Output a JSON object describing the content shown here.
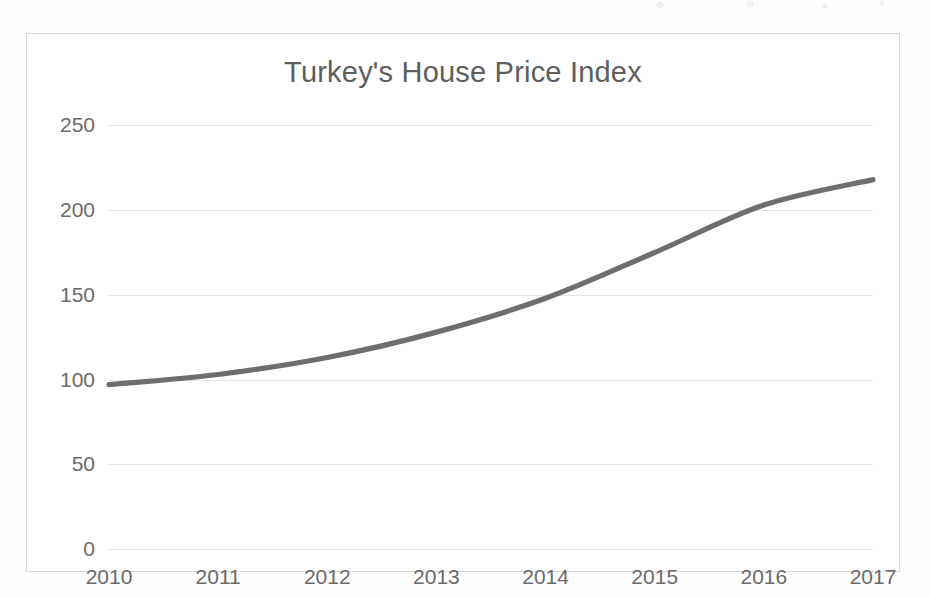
{
  "chart_data": {
    "type": "line",
    "title": "Turkey's House Price Index",
    "xlabel": "",
    "ylabel": "",
    "categories": [
      "2010",
      "2011",
      "2012",
      "2013",
      "2014",
      "2015",
      "2016",
      "2017"
    ],
    "x": [
      2010,
      2011,
      2012,
      2013,
      2014,
      2015,
      2016,
      2017
    ],
    "values": [
      97,
      103,
      113,
      128,
      148,
      175,
      203,
      218
    ],
    "series": [
      {
        "name": "House Price Index",
        "values": [
          97,
          103,
          113,
          128,
          148,
          175,
          203,
          218
        ]
      }
    ],
    "ylim": [
      0,
      265
    ],
    "yticks": [
      0,
      50,
      100,
      150,
      200,
      250
    ],
    "ytick_labels": [
      "0",
      "50",
      "100",
      "150",
      "200",
      "250"
    ],
    "xtick_labels": [
      "2010",
      "2011",
      "2012",
      "2013",
      "2014",
      "2015",
      "2016",
      "2017"
    ],
    "grid": "horizontal",
    "legend": "none",
    "line_color": "#6e6e6e",
    "gridline_color": "#e4e4e4",
    "axis_text_color": "#6a6a6a",
    "title_color": "#5e5e5e",
    "background_color": "#ffffff",
    "frame_color": "#d8d8d8",
    "smoothing": "smooth"
  }
}
